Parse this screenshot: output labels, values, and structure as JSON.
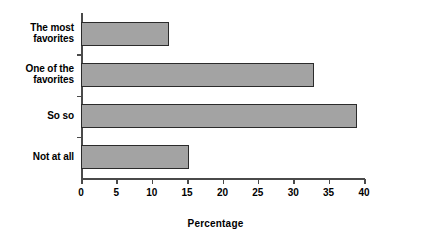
{
  "chart_data": {
    "type": "bar",
    "orientation": "horizontal",
    "title": "",
    "subtitle": "",
    "xlabel": "Percentage",
    "ylabel": "",
    "categories": [
      "The most\nfavorites",
      "One of the\nfavorites",
      "So so",
      "Not at all"
    ],
    "values": [
      12.5,
      32.9,
      39.0,
      15.3
    ],
    "xlim": [
      0,
      40
    ],
    "xticks": [
      0,
      5,
      10,
      15,
      20,
      25,
      30,
      35,
      40
    ],
    "xtick_labels": [
      "0",
      "5",
      "10",
      "15",
      "20",
      "25",
      "30",
      "35",
      "40"
    ],
    "grid": false,
    "legend": null,
    "legend_position": "none",
    "bar_fill_color": "#a3a3a3",
    "bar_border_color": "#2b2b2b",
    "axis_color": "#4a4a4a",
    "background_color": "#ffffff",
    "text_color": "#000000"
  }
}
